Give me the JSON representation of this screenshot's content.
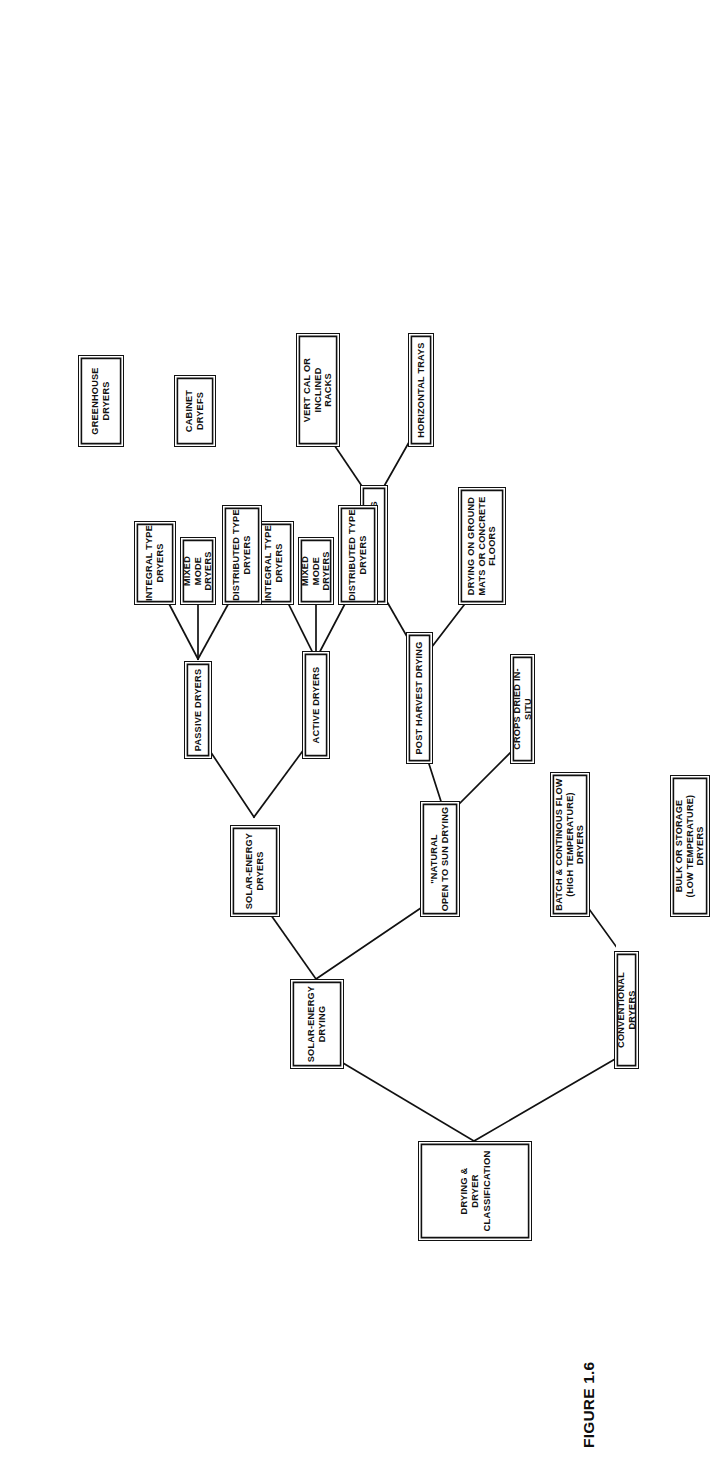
{
  "figure": {
    "caption": "FIGURE 1.6",
    "title": "DRYING & DRYER CLASSIFICATION",
    "orientation": "rotated-90-ccw",
    "line_color": "#111111",
    "box_border_color": "#111111",
    "background_color": "#ffffff"
  },
  "nodes": {
    "root": "DRYING &\nDRYER\nCLASSIFICATION",
    "conventional_dryers": "CONVENTIONAL DRYERS",
    "solar_energy_drying": "SOLAR-ENERGY\nDRYING",
    "bulk_or_storage": "BULK OR STORAGE\n(LOW TEMPERATURE) DRYERS",
    "batch_continuous": "BATCH & CONTINOUS FLOW\n(HIGH TEMPERATURE) DRYERS",
    "natural_open_sun": "\"NATURAL\nOPEN TO SUN DRYING",
    "solar_energy_dryers": "SOLAR-ENERGY\nDRYERS",
    "crops_dried_in_situ": "CROPS DRIED IN-SITU",
    "post_harvest_drying": "POST HARVEST DRYING",
    "drying_on_ground": "DRYING ON GROUND\nMATS OR CONCRETE\nFLOORS",
    "drying_on_trays": "DRYING ON TRAYS",
    "horizontal_trays": "HORIZONTAL TRAYS",
    "vertical_inclined_racks": "VERT CAL OR INCLINED\nRACKS",
    "active_dryers": "ACTIVE DRYERS",
    "passive_dryers": "PASSIVE DRYERS",
    "active_distributed": "DISTRIBUTED TYPE\nDRYERS",
    "active_mixed_mode": "MIXED MODE\nDRYERS",
    "active_integral": "INTEGRAL TYPE\nDRYERS",
    "passive_distributed": "DISTRIBUTED TYPE\nDRYERS",
    "passive_mixed_mode": "MIXED MODE\nDRYERS",
    "passive_integral": "INTEGRAL TYPE\nDRYERS",
    "cabinet_dryers": "CABINET\nDRYEFS",
    "greenhouse_dryers": "GREENHOUSE\nDRYERS"
  },
  "hierarchy": {
    "DRYING & DRYER CLASSIFICATION": [
      {
        "CONVENTIONAL DRYERS": [
          "BULK OR STORAGE (LOW TEMPERATURE) DRYERS",
          "BATCH & CONTINOUS FLOW (HIGH TEMPERATURE) DRYERS"
        ]
      },
      {
        "SOLAR-ENERGY DRYING": [
          {
            "\"NATURAL OPEN TO SUN DRYING": [
              "CROPS DRIED IN-SITU",
              {
                "POST HARVEST DRYING": [
                  "DRYING ON GROUND MATS OR CONCRETE FLOORS",
                  {
                    "DRYING ON TRAYS": [
                      "HORIZONTAL TRAYS",
                      "VERT CAL OR INCLINED RACKS"
                    ]
                  }
                ]
              }
            ]
          },
          {
            "SOLAR-ENERGY DRYERS": [
              {
                "ACTIVE DRYERS": [
                  "DISTRIBUTED TYPE DRYERS",
                  "MIXED MODE DRYERS",
                  "INTEGRAL TYPE DRYERS"
                ]
              },
              {
                "PASSIVE DRYERS": [
                  "DISTRIBUTED TYPE DRYERS",
                  "MIXED MODE DRYERS",
                  {
                    "INTEGRAL TYPE DRYERS": [
                      "CABINET DRYEFS",
                      "GREENHOUSE DRYERS"
                    ]
                  }
                ]
              }
            ]
          }
        ]
      }
    ]
  }
}
